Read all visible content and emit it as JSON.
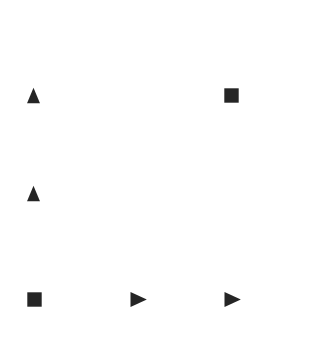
{
  "canvas": {
    "width": 314,
    "height": 363,
    "background_color": "#ffffff",
    "marker_color": "#252525"
  },
  "chart_data": {
    "type": "scatter",
    "title": "",
    "subtitle": "",
    "xlabel": "",
    "ylabel": "",
    "grid": false,
    "legend": "none",
    "axis_visible": false,
    "tick_labels_x": [],
    "tick_labels_y": [],
    "xlim": [
      0,
      314
    ],
    "ylim": [
      0,
      363
    ],
    "annotations": [],
    "points": [
      {
        "id": "marker-1",
        "shape": "triangle-up",
        "x": 33,
        "y": 95,
        "size": 17,
        "color": "#252525"
      },
      {
        "id": "marker-2",
        "shape": "square",
        "x": 231,
        "y": 95,
        "size": 15,
        "color": "#252525"
      },
      {
        "id": "marker-3",
        "shape": "triangle-up",
        "x": 33,
        "y": 193,
        "size": 17,
        "color": "#252525"
      },
      {
        "id": "marker-4",
        "shape": "square",
        "x": 34,
        "y": 299,
        "size": 15,
        "color": "#252525"
      },
      {
        "id": "marker-5",
        "shape": "triangle-right",
        "x": 138,
        "y": 299,
        "size": 17,
        "color": "#252525"
      },
      {
        "id": "marker-6",
        "shape": "triangle-right",
        "x": 232,
        "y": 299,
        "size": 17,
        "color": "#252525"
      }
    ]
  }
}
